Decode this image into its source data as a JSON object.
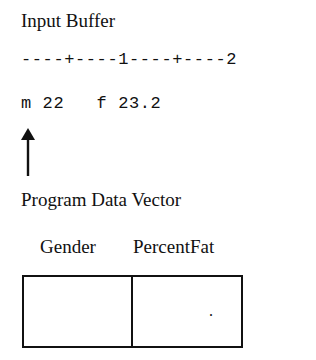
{
  "input_buffer": {
    "title": "Input Buffer",
    "ruler": "----+----1----+----2",
    "content": "m 22   f 23.2",
    "pointer_column": 1
  },
  "program_data_vector": {
    "title": "Program Data Vector",
    "columns": [
      {
        "name": "Gender",
        "value": ""
      },
      {
        "name": "PercentFat",
        "value": "."
      }
    ]
  },
  "colors": {
    "ink": "#111111",
    "background": "#ffffff"
  }
}
